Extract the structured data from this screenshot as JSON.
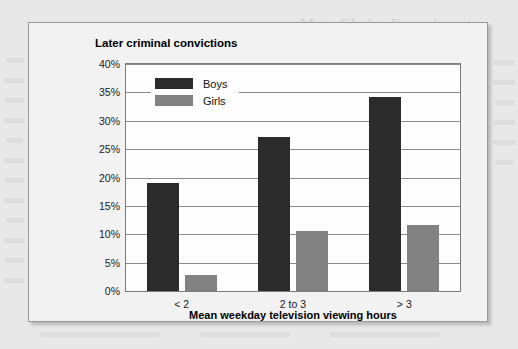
{
  "page": {
    "ghost_headings": [
      "Mate Choice Experiments",
      "Appearance, Allied Marking and"
    ],
    "background_color": "#e8e8e8"
  },
  "figure": {
    "border_color": "#9a9a9a",
    "background_color": "#f2f2f2"
  },
  "chart_data": {
    "type": "bar",
    "title": "Later criminal convictions",
    "xlabel": "Mean weekday television viewing hours",
    "ylabel": "",
    "categories": [
      "< 2",
      "2 to 3",
      "> 3"
    ],
    "series": [
      {
        "name": "Boys",
        "color": "#2b2b2b",
        "values": [
          19,
          27.2,
          34.2
        ]
      },
      {
        "name": "Girls",
        "color": "#828282",
        "values": [
          2.9,
          10.6,
          11.6
        ]
      }
    ],
    "ylim": [
      0,
      40
    ],
    "ytick_values": [
      0,
      5,
      10,
      15,
      20,
      25,
      30,
      35,
      40
    ],
    "ytick_labels": [
      "0%",
      "5%",
      "10%",
      "15%",
      "20%",
      "25%",
      "30%",
      "35%",
      "40%"
    ],
    "grid": true,
    "legend_position": "top-left",
    "value_suffix": "%"
  }
}
